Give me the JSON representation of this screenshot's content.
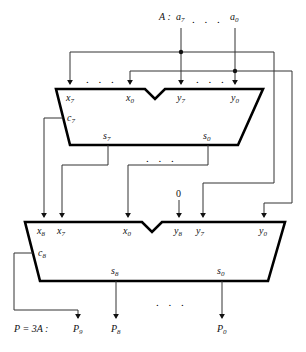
{
  "figure": {
    "top_input_label": "A :",
    "top_input_msb": "a",
    "top_input_msb_sub": "7",
    "top_input_lsb": "a",
    "top_input_lsb_sub": "0",
    "ellipsis": ". . .",
    "constant_zero": "0"
  },
  "adder1": {
    "name": "upper-adder",
    "inputs": [
      {
        "base": "x",
        "sub": "7"
      },
      {
        "base": "x",
        "sub": "0"
      },
      {
        "base": "y",
        "sub": "7"
      },
      {
        "base": "y",
        "sub": "0"
      }
    ],
    "carry_out": {
      "base": "c",
      "sub": "7"
    },
    "sums": [
      {
        "base": "s",
        "sub": "7"
      },
      {
        "base": "s",
        "sub": "0"
      }
    ]
  },
  "adder2": {
    "name": "lower-adder",
    "inputs": [
      {
        "base": "x",
        "sub": "8"
      },
      {
        "base": "x",
        "sub": "7"
      },
      {
        "base": "x",
        "sub": "0"
      },
      {
        "base": "y",
        "sub": "8"
      },
      {
        "base": "y",
        "sub": "7"
      },
      {
        "base": "y",
        "sub": "0"
      }
    ],
    "carry_out": {
      "base": "c",
      "sub": "8"
    },
    "sums": [
      {
        "base": "s",
        "sub": "8"
      },
      {
        "base": "s",
        "sub": "0"
      }
    ]
  },
  "outputs": {
    "result_label": "P = 3A :",
    "bits": [
      {
        "base": "P",
        "sub": "9"
      },
      {
        "base": "P",
        "sub": "8"
      },
      {
        "base": "P",
        "sub": "0"
      }
    ]
  },
  "colors": {
    "line": "#1a1a1a",
    "box_outline": "#000000",
    "background": "#ffffff"
  }
}
